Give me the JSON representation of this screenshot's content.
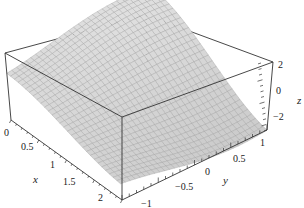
{
  "chart_data": {
    "type": "surface3d",
    "title": "",
    "x_axis": {
      "label": "x",
      "range": [
        0,
        2
      ],
      "ticks": [
        "0",
        "0.5",
        "1",
        "1.5",
        "2"
      ]
    },
    "y_axis": {
      "label": "y",
      "range": [
        -1,
        1
      ],
      "ticks": [
        "-1",
        "-0.5",
        "0",
        "0.5",
        "1"
      ]
    },
    "z_axis": {
      "label": "z",
      "range": [
        -3,
        3
      ],
      "ticks": [
        "-2",
        "0",
        "2"
      ]
    },
    "surface": {
      "style": "mesh",
      "face_color": "#e4e4e4",
      "mesh_color": "#9a9a9a",
      "grid_lines": 30
    },
    "box": true,
    "box_color": "#333333",
    "grid": false,
    "legend": "none"
  },
  "labels": {
    "x": "x",
    "y": "y",
    "z": "z",
    "x_ticks": [
      "0",
      "0.5",
      "1",
      "1.5",
      "2"
    ],
    "y_ticks": [
      "−1",
      "−0.5",
      "0",
      "0.5",
      "1"
    ],
    "z_ticks": [
      "2",
      "0",
      "−2"
    ]
  }
}
